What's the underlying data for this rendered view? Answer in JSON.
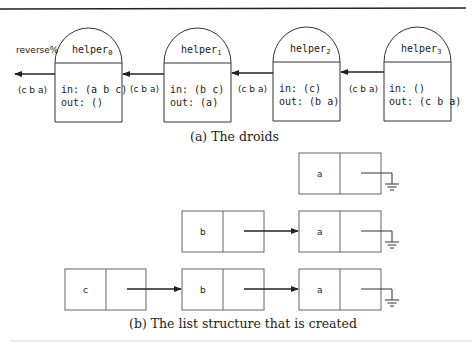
{
  "figure": {
    "droids": {
      "output_label": "reverse%",
      "output_value": "(c b a)",
      "caption": "(a) The droids",
      "helpers": [
        {
          "name": "helper",
          "sub": "0",
          "in": "in: (a b c)",
          "out": "out: ()",
          "pass_in": "(c b a)"
        },
        {
          "name": "helper",
          "sub": "1",
          "in": "in: (b c)",
          "out": "out: (a)",
          "pass_in": "(c b a)"
        },
        {
          "name": "helper",
          "sub": "2",
          "in": "in: (c)",
          "out": "out: (b a)",
          "pass_in": "(c b a)"
        },
        {
          "name": "helper",
          "sub": "3",
          "in": "in: ()",
          "out": "out: (c b a)",
          "pass_in": ""
        }
      ]
    },
    "lists": {
      "caption": "(b) The list structure that is created",
      "rows": [
        {
          "cells": [
            "a"
          ]
        },
        {
          "cells": [
            "b",
            "a"
          ]
        },
        {
          "cells": [
            "c",
            "b",
            "a"
          ]
        }
      ]
    }
  }
}
